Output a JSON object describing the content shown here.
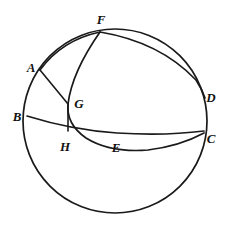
{
  "figure": {
    "background_color": "#ffffff",
    "stroke_color": "#1a1a1a",
    "width": 229,
    "height": 226
  },
  "circle": {
    "name": "main-circle",
    "cx": 115,
    "cy": 121,
    "r": 92
  },
  "labels": [
    {
      "id": "F",
      "text": "F",
      "x": 101,
      "y": 19
    },
    {
      "id": "A",
      "text": "A",
      "x": 31,
      "y": 67
    },
    {
      "id": "D",
      "text": "D",
      "x": 211,
      "y": 97
    },
    {
      "id": "G",
      "text": "G",
      "x": 79,
      "y": 103
    },
    {
      "id": "B",
      "text": "B",
      "x": 17,
      "y": 116
    },
    {
      "id": "C",
      "text": "C",
      "x": 211,
      "y": 138
    },
    {
      "id": "H",
      "text": "H",
      "x": 65,
      "y": 146
    },
    {
      "id": "E",
      "text": "E",
      "x": 116,
      "y": 147
    }
  ],
  "points": [
    {
      "id": "F",
      "x": 100,
      "y": 32,
      "on_circle": true
    },
    {
      "id": "A",
      "x": 40,
      "y": 70,
      "on_circle": true
    },
    {
      "id": "B",
      "x": 27,
      "y": 116,
      "on_circle": true
    },
    {
      "id": "D",
      "x": 205,
      "y": 98,
      "on_circle": true
    },
    {
      "id": "C",
      "x": 204,
      "y": 133,
      "on_circle": true
    },
    {
      "id": "G",
      "x": 68,
      "y": 104,
      "on_circle": false
    },
    {
      "id": "H",
      "x": 68,
      "y": 130,
      "on_circle": false
    },
    {
      "id": "E",
      "x": 117,
      "y": 133,
      "on_circle": false
    }
  ],
  "curves": [
    {
      "id": "arc-A-F-D",
      "name": "arc-afd",
      "from": "A",
      "through": "F",
      "to": "D",
      "path": "M 40 70 Q 62 40 100 32 Q 160 42 196 80 Q 202 89 205 98"
    },
    {
      "id": "arc-F-G-E-C",
      "name": "arc-fgec",
      "from": "F",
      "through": "E",
      "to": "C",
      "path": "M 100 32 Q 72 72 68 104 Q 66 124 86 138 Q 110 153 148 150 Q 180 146 204 133"
    },
    {
      "id": "arc-B-E-C",
      "name": "arc-bec",
      "from": "B",
      "through": "E",
      "to": "C",
      "path": "M 27 116 Q 72 130 117 133 Q 165 136 204 131"
    }
  ],
  "segments": [
    {
      "id": "seg-A-G",
      "name": "segment-ag",
      "from": "A",
      "to": "G",
      "x1": 40,
      "y1": 70,
      "x2": 68,
      "y2": 104
    },
    {
      "id": "seg-G-H",
      "name": "segment-gh",
      "from": "G",
      "to": "H",
      "x1": 68,
      "y1": 104,
      "x2": 68,
      "y2": 131
    }
  ]
}
